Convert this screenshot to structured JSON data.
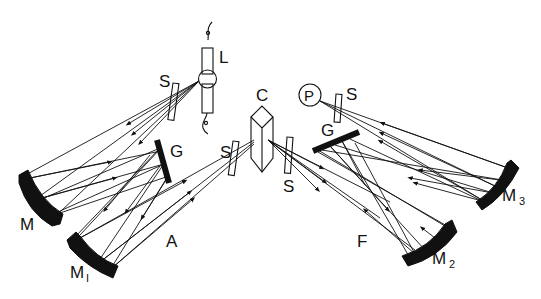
{
  "diagram": {
    "colors": {
      "ink": "#111111",
      "background": "#ffffff"
    },
    "labels": {
      "lamp": "L",
      "slit_entrance": "S",
      "slit_prism_in": "S",
      "slit_prism_out": "S",
      "slit_detector": "S",
      "mirror_M": "M",
      "mirror_M1_main": "M",
      "mirror_M1_sub": "I",
      "mirror_M2_main": "M",
      "mirror_M2_sub": "2",
      "mirror_M3_main": "M",
      "mirror_M3_sub": "3",
      "grating_left": "G",
      "grating_right": "G",
      "prism": "C",
      "detector": "P",
      "section_A": "A",
      "section_F": "F"
    },
    "components": [
      {
        "id": "L",
        "type": "lamp",
        "label": "L"
      },
      {
        "id": "S1",
        "type": "slit",
        "label": "S"
      },
      {
        "id": "M",
        "type": "concave-mirror",
        "label": "M"
      },
      {
        "id": "G1",
        "type": "grating",
        "label": "G"
      },
      {
        "id": "M1",
        "type": "concave-mirror",
        "label": "M1"
      },
      {
        "id": "S2",
        "type": "slit",
        "label": "S"
      },
      {
        "id": "C",
        "type": "prism",
        "label": "C"
      },
      {
        "id": "S3",
        "type": "slit",
        "label": "S"
      },
      {
        "id": "G2",
        "type": "grating",
        "label": "G"
      },
      {
        "id": "M2",
        "type": "concave-mirror",
        "label": "M2"
      },
      {
        "id": "M3",
        "type": "concave-mirror",
        "label": "M3"
      },
      {
        "id": "S4",
        "type": "slit",
        "label": "S"
      },
      {
        "id": "P",
        "type": "detector",
        "label": "P"
      }
    ],
    "sections": [
      "A",
      "F"
    ]
  }
}
